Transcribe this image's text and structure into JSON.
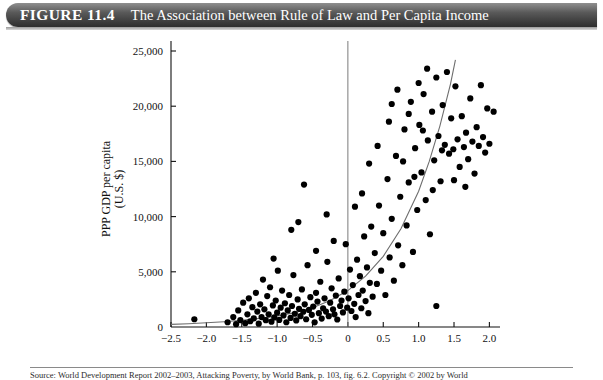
{
  "header": {
    "figure_number": "FIGURE 11.4",
    "title": "The Association between Rule of Law and Per Capita Income"
  },
  "footer": {
    "source_note": "Source: World Development Report 2002–2003, Attacking Poverty, by World Bank, p. 103, fig. 6.2. Copyright © 2002 by World"
  },
  "chart_data": {
    "type": "scatter",
    "title": "The Association between Rule of Law and Per Capita Income",
    "xlabel": "Rule of law index",
    "ylabel": "PPP GDP per capita (U.S. $)",
    "ylabel_line1": "PPP GDP per capita",
    "ylabel_line2": "(U.S. $)",
    "xlim": [
      -2.5,
      2.15
    ],
    "ylim": [
      0,
      25000
    ],
    "xticks": [
      -2.5,
      -2.0,
      -1.5,
      -1.0,
      -0.5,
      0,
      0.5,
      1.0,
      1.5,
      2.0
    ],
    "xticklabels": [
      "−2.5",
      "−2.0",
      "−1.5",
      "−1.0",
      "−0.5",
      "0",
      "0.5",
      "1.0",
      "1.5",
      "2.0"
    ],
    "yticks": [
      0,
      5000,
      10000,
      15000,
      20000,
      25000
    ],
    "yticklabels": [
      "0",
      "5,000",
      "10,000",
      "15,000",
      "20,000",
      "25,000"
    ],
    "grid": false,
    "legend": null,
    "marker_color": "#000000",
    "marker_size": 3.1,
    "fit_curve": {
      "type": "exponential",
      "color": "#6e6e6e",
      "label": "exponential fit",
      "points": [
        [
          -2.5,
          240
        ],
        [
          -2.25,
          300
        ],
        [
          -2.0,
          380
        ],
        [
          -1.75,
          480
        ],
        [
          -1.5,
          610
        ],
        [
          -1.25,
          780
        ],
        [
          -1.0,
          1000
        ],
        [
          -0.75,
          1300
        ],
        [
          -0.5,
          1750
        ],
        [
          -0.25,
          2400
        ],
        [
          0.0,
          3300
        ],
        [
          0.25,
          4600
        ],
        [
          0.5,
          6400
        ],
        [
          0.75,
          8900
        ],
        [
          1.0,
          12300
        ],
        [
          1.15,
          15000
        ],
        [
          1.3,
          18200
        ],
        [
          1.45,
          22000
        ],
        [
          1.52,
          24200
        ]
      ]
    },
    "axis_marker_vertical_x": 0,
    "points": [
      [
        -2.17,
        700
      ],
      [
        -1.7,
        430
      ],
      [
        -1.62,
        900
      ],
      [
        -1.58,
        260
      ],
      [
        -1.55,
        1500
      ],
      [
        -1.52,
        620
      ],
      [
        -1.48,
        2200
      ],
      [
        -1.45,
        350
      ],
      [
        -1.42,
        1150
      ],
      [
        -1.4,
        2600
      ],
      [
        -1.38,
        520
      ],
      [
        -1.35,
        1800
      ],
      [
        -1.33,
        780
      ],
      [
        -1.3,
        3100
      ],
      [
        -1.28,
        1400
      ],
      [
        -1.26,
        300
      ],
      [
        -1.24,
        2050
      ],
      [
        -1.22,
        900
      ],
      [
        -1.2,
        4300
      ],
      [
        -1.18,
        1600
      ],
      [
        -1.16,
        620
      ],
      [
        -1.14,
        2800
      ],
      [
        -1.12,
        1150
      ],
      [
        -1.1,
        3600
      ],
      [
        -1.08,
        480
      ],
      [
        -1.06,
        1950
      ],
      [
        -1.04,
        870
      ],
      [
        -1.02,
        2400
      ],
      [
        -1.0,
        1300
      ],
      [
        -0.99,
        5100
      ],
      [
        -0.97,
        640
      ],
      [
        -0.95,
        1750
      ],
      [
        -0.93,
        3300
      ],
      [
        -0.91,
        1050
      ],
      [
        -0.89,
        2150
      ],
      [
        -0.87,
        430
      ],
      [
        -0.85,
        1500
      ],
      [
        -0.83,
        2900
      ],
      [
        -0.81,
        820
      ],
      [
        -0.79,
        1900
      ],
      [
        -0.77,
        4700
      ],
      [
        -0.75,
        1200
      ],
      [
        -0.73,
        600
      ],
      [
        -0.71,
        2500
      ],
      [
        -0.69,
        1650
      ],
      [
        -0.67,
        980
      ],
      [
        -0.65,
        3400
      ],
      [
        -0.63,
        1380
      ],
      [
        -0.61,
        2050
      ],
      [
        -0.59,
        700
      ],
      [
        -0.57,
        5600
      ],
      [
        -0.55,
        1550
      ],
      [
        -0.53,
        2700
      ],
      [
        -0.51,
        1100
      ],
      [
        -0.49,
        1850
      ],
      [
        -0.47,
        420
      ],
      [
        -0.45,
        3100
      ],
      [
        -0.43,
        2300
      ],
      [
        -0.41,
        1250
      ],
      [
        -0.39,
        4100
      ],
      [
        -0.37,
        760
      ],
      [
        -0.35,
        1700
      ],
      [
        -0.33,
        2600
      ],
      [
        -0.31,
        1400
      ],
      [
        -0.29,
        5900
      ],
      [
        -0.27,
        980
      ],
      [
        -0.25,
        2200
      ],
      [
        -0.23,
        3500
      ],
      [
        -0.21,
        1600
      ],
      [
        -0.19,
        1150
      ],
      [
        -0.17,
        2850
      ],
      [
        -0.15,
        680
      ],
      [
        -0.13,
        4400
      ],
      [
        -0.11,
        1900
      ],
      [
        -0.09,
        2400
      ],
      [
        -0.07,
        1320
      ],
      [
        -0.05,
        3200
      ],
      [
        -0.03,
        7500
      ],
      [
        -0.01,
        1750
      ],
      [
        0.01,
        2600
      ],
      [
        0.03,
        5200
      ],
      [
        0.05,
        1450
      ],
      [
        0.07,
        3800
      ],
      [
        0.09,
        2100
      ],
      [
        0.11,
        900
      ],
      [
        0.13,
        6100
      ],
      [
        0.15,
        2900
      ],
      [
        0.17,
        4600
      ],
      [
        0.19,
        1700
      ],
      [
        0.21,
        3300
      ],
      [
        0.23,
        8200
      ],
      [
        0.25,
        2350
      ],
      [
        0.27,
        5400
      ],
      [
        0.29,
        1250
      ],
      [
        0.31,
        4000
      ],
      [
        0.33,
        9100
      ],
      [
        0.35,
        2750
      ],
      [
        0.38,
        6700
      ],
      [
        0.41,
        3900
      ],
      [
        0.44,
        11000
      ],
      [
        0.47,
        5100
      ],
      [
        0.5,
        8500
      ],
      [
        0.53,
        2900
      ],
      [
        0.56,
        13400
      ],
      [
        0.59,
        6300
      ],
      [
        0.62,
        9800
      ],
      [
        0.65,
        4200
      ],
      [
        0.68,
        15500
      ],
      [
        0.71,
        7400
      ],
      [
        0.74,
        11800
      ],
      [
        0.77,
        5600
      ],
      [
        0.8,
        17900
      ],
      [
        0.83,
        9200
      ],
      [
        0.86,
        13100
      ],
      [
        0.89,
        20400
      ],
      [
        0.92,
        6800
      ],
      [
        0.95,
        16200
      ],
      [
        0.98,
        10600
      ],
      [
        1.01,
        18300
      ],
      [
        1.04,
        14000
      ],
      [
        1.07,
        21100
      ],
      [
        1.1,
        11500
      ],
      [
        1.13,
        16900
      ],
      [
        1.16,
        8400
      ],
      [
        1.19,
        19500
      ],
      [
        1.22,
        15100
      ],
      [
        1.25,
        22600
      ],
      [
        1.25,
        1900
      ],
      [
        1.28,
        17300
      ],
      [
        1.31,
        13200
      ],
      [
        1.34,
        20100
      ],
      [
        1.37,
        16500
      ],
      [
        1.4,
        23100
      ],
      [
        1.43,
        15700
      ],
      [
        1.46,
        18900
      ],
      [
        1.49,
        16100
      ],
      [
        1.52,
        21800
      ],
      [
        1.55,
        17000
      ],
      [
        1.58,
        14500
      ],
      [
        1.61,
        19100
      ],
      [
        1.64,
        16300
      ],
      [
        1.67,
        17600
      ],
      [
        1.7,
        15200
      ],
      [
        1.73,
        20700
      ],
      [
        1.76,
        16800
      ],
      [
        1.79,
        13900
      ],
      [
        1.82,
        18100
      ],
      [
        1.85,
        16400
      ],
      [
        1.88,
        21900
      ],
      [
        1.91,
        17200
      ],
      [
        1.94,
        15800
      ],
      [
        1.97,
        19800
      ],
      [
        2.0,
        16600
      ],
      [
        2.06,
        19500
      ],
      [
        -0.62,
        12900
      ],
      [
        -0.3,
        10200
      ],
      [
        0.3,
        14800
      ],
      [
        0.58,
        18600
      ],
      [
        0.7,
        21500
      ],
      [
        0.86,
        19300
      ],
      [
        1.0,
        22100
      ],
      [
        1.12,
        23400
      ],
      [
        -0.8,
        8800
      ],
      [
        -0.45,
        6900
      ],
      [
        0.2,
        12100
      ],
      [
        0.42,
        16400
      ],
      [
        0.62,
        20200
      ],
      [
        0.78,
        15000
      ],
      [
        0.94,
        13600
      ],
      [
        1.06,
        17800
      ],
      [
        -1.05,
        6200
      ],
      [
        -0.7,
        9500
      ],
      [
        -0.2,
        7800
      ],
      [
        0.1,
        10900
      ],
      [
        1.33,
        16000
      ],
      [
        1.5,
        13300
      ],
      [
        1.66,
        12700
      ],
      [
        1.2,
        12400
      ]
    ]
  }
}
